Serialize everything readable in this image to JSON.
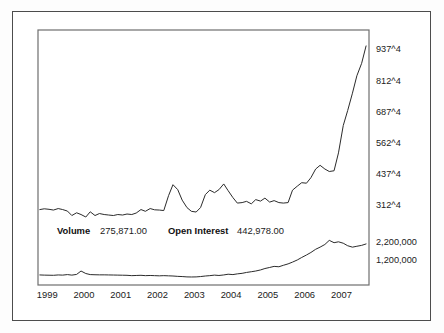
{
  "figure": {
    "background_color": "#ffffff",
    "border_color": "#4c4c4c",
    "plot_frame_color": "#6e6e6e",
    "line_color": "#2b2b2b"
  },
  "legend": {
    "volume_label": "Volume",
    "volume_value": "275,871.00",
    "open_interest_label": "Open Interest",
    "open_interest_value": "442,978.00"
  },
  "chart_data": {
    "type": "line",
    "title": "",
    "subtitle": "",
    "xlabel": "",
    "ylabel": "",
    "grid": false,
    "legend_position": "inside-left-middle",
    "x_axis": {
      "tick_labels": [
        "1999",
        "2000",
        "2001",
        "2002",
        "2003",
        "2004",
        "2005",
        "2006",
        "2007"
      ],
      "tick_positions": [
        1999,
        2000,
        2001,
        2002,
        2003,
        2004,
        2005,
        2006,
        2007
      ],
      "range": [
        1998.75,
        2007.75
      ]
    },
    "price_axis": {
      "tick_labels": [
        "937^4",
        "812^4",
        "687^4",
        "562^4",
        "437^4",
        "312^4"
      ],
      "tick_values": [
        937.5,
        812.5,
        687.5,
        562.5,
        437.5,
        312.5
      ],
      "range": [
        250,
        990
      ],
      "side": "right"
    },
    "volume_axis": {
      "tick_labels": [
        "2,200,000",
        "1,200,000"
      ],
      "tick_values": [
        2200000,
        1200000
      ],
      "range": [
        0,
        2750000
      ],
      "side": "right"
    },
    "series": [
      {
        "name": "Price",
        "axis": "price",
        "x": [
          1998.8,
          1998.92,
          1999.05,
          1999.17,
          1999.3,
          1999.42,
          1999.55,
          1999.67,
          1999.8,
          1999.92,
          2000.05,
          2000.17,
          2000.3,
          2000.42,
          2000.55,
          2000.67,
          2000.8,
          2000.92,
          2001.05,
          2001.17,
          2001.3,
          2001.42,
          2001.55,
          2001.67,
          2001.8,
          2001.92,
          2002.05,
          2002.17,
          2002.3,
          2002.42,
          2002.55,
          2002.67,
          2002.8,
          2002.92,
          2003.05,
          2003.17,
          2003.3,
          2003.42,
          2003.55,
          2003.67,
          2003.8,
          2003.92,
          2004.05,
          2004.17,
          2004.3,
          2004.42,
          2004.55,
          2004.67,
          2004.8,
          2004.92,
          2005.05,
          2005.17,
          2005.3,
          2005.42,
          2005.55,
          2005.67,
          2005.8,
          2005.92,
          2006.05,
          2006.17,
          2006.3,
          2006.42,
          2006.55,
          2006.67,
          2006.8,
          2006.92,
          2007.05,
          2007.17,
          2007.3,
          2007.42,
          2007.55,
          2007.67
        ],
        "values": [
          292,
          295,
          293,
          290,
          296,
          292,
          286,
          268,
          279,
          272,
          262,
          283,
          268,
          276,
          272,
          270,
          268,
          272,
          270,
          274,
          272,
          278,
          292,
          285,
          296,
          291,
          290,
          288,
          348,
          392,
          372,
          330,
          300,
          285,
          282,
          300,
          352,
          370,
          360,
          372,
          395,
          368,
          340,
          318,
          320,
          325,
          315,
          332,
          326,
          338,
          322,
          328,
          320,
          318,
          320,
          370,
          386,
          400,
          398,
          420,
          455,
          470,
          455,
          445,
          448,
          520,
          630,
          690,
          760,
          830,
          880,
          950
        ]
      },
      {
        "name": "Volume",
        "axis": "volume",
        "x": [
          1998.8,
          1998.92,
          1999.05,
          1999.17,
          1999.3,
          1999.42,
          1999.55,
          1999.67,
          1999.8,
          1999.92,
          2000.05,
          2000.17,
          2000.3,
          2000.42,
          2000.55,
          2000.67,
          2000.8,
          2000.92,
          2001.05,
          2001.17,
          2001.3,
          2001.42,
          2001.55,
          2001.67,
          2001.8,
          2001.92,
          2002.05,
          2002.17,
          2002.3,
          2002.42,
          2002.55,
          2002.67,
          2002.8,
          2002.92,
          2003.05,
          2003.17,
          2003.3,
          2003.42,
          2003.55,
          2003.67,
          2003.8,
          2003.92,
          2004.05,
          2004.17,
          2004.3,
          2004.42,
          2004.55,
          2004.67,
          2004.8,
          2004.92,
          2005.05,
          2005.17,
          2005.3,
          2005.42,
          2005.55,
          2005.67,
          2005.8,
          2005.92,
          2006.05,
          2006.17,
          2006.3,
          2006.42,
          2006.55,
          2006.67,
          2006.8,
          2006.92,
          2007.05,
          2007.17,
          2007.3,
          2007.42,
          2007.55,
          2007.67
        ],
        "values": [
          340000,
          330000,
          325000,
          320000,
          340000,
          330000,
          360000,
          330000,
          370000,
          560000,
          420000,
          360000,
          350000,
          345000,
          345000,
          340000,
          335000,
          330000,
          325000,
          320000,
          300000,
          310000,
          320000,
          300000,
          310000,
          300000,
          290000,
          300000,
          290000,
          280000,
          260000,
          250000,
          230000,
          225000,
          230000,
          250000,
          280000,
          300000,
          330000,
          310000,
          340000,
          380000,
          360000,
          400000,
          430000,
          480000,
          520000,
          560000,
          620000,
          700000,
          760000,
          820000,
          800000,
          880000,
          960000,
          1060000,
          1180000,
          1320000,
          1460000,
          1600000,
          1780000,
          1900000,
          2050000,
          2280000,
          2150000,
          2200000,
          2120000,
          1980000,
          1900000,
          1950000,
          2000000,
          2080000
        ]
      }
    ]
  }
}
